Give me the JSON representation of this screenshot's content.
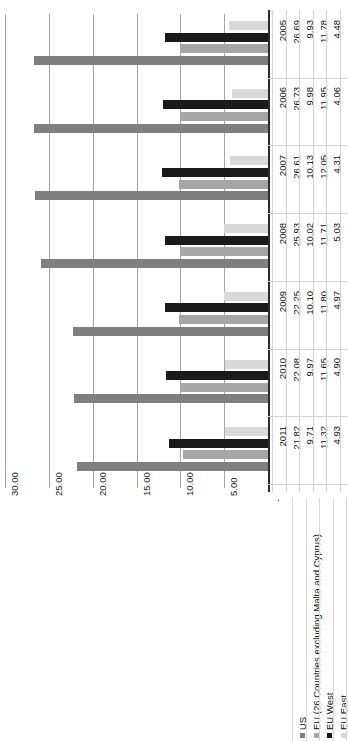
{
  "chart_data": {
    "type": "bar",
    "orientation": "horizontal",
    "title": "",
    "xlabel": "",
    "ylabel": "",
    "categories": [
      "2005",
      "2006",
      "2007",
      "2008",
      "2009",
      "2010",
      "2011"
    ],
    "series": [
      {
        "name": "US",
        "color": "#7f7f7f",
        "values": [
          26.69,
          26.73,
          26.61,
          25.93,
          22.25,
          22.08,
          21.82
        ]
      },
      {
        "name": "EU (26 Countries excluding Malta and Cyprus)",
        "color": "#a6a6a6",
        "values": [
          9.93,
          9.98,
          10.13,
          10.02,
          10.1,
          9.97,
          9.71
        ]
      },
      {
        "name": "EU West",
        "color": "#1a1a1a",
        "values": [
          11.78,
          11.95,
          12.05,
          11.71,
          11.8,
          11.65,
          11.32
        ]
      },
      {
        "name": "EU East",
        "color": "#d9d9d9",
        "values": [
          4.48,
          4.06,
          4.31,
          5.03,
          4.97,
          4.9,
          4.93
        ]
      }
    ],
    "axis_ticks": [
      "-",
      "5.00",
      "10.00",
      "15.00",
      "20.00",
      "25.00",
      "30.00"
    ],
    "axis_tick_values": [
      0,
      5,
      10,
      15,
      20,
      25,
      30
    ],
    "xlim": [
      0,
      30
    ],
    "grid": true,
    "legend_position": "bottom",
    "data_table": {
      "columns": [
        "2005",
        "2006",
        "2007",
        "2008",
        "2009",
        "2010",
        "2011"
      ],
      "rows": [
        {
          "label": "US",
          "values": [
            "26.69",
            "26.73",
            "26.61",
            "25.93",
            "22.25",
            "22.08",
            "21.82"
          ]
        },
        {
          "label": "EU (26 Countries excluding Malta and Cyprus)",
          "values": [
            "9.93",
            "9.98",
            "10.13",
            "10.02",
            "10.10",
            "9.97",
            "9.71"
          ]
        },
        {
          "label": "EU West",
          "values": [
            "11.78",
            "11.95",
            "12.05",
            "11.71",
            "11.80",
            "11.65",
            "11.32"
          ]
        },
        {
          "label": "EU East",
          "values": [
            "4.48",
            "4.06",
            "4.31",
            "5.03",
            "4.97",
            "4.90",
            "4.93"
          ]
        }
      ]
    },
    "legend": [
      {
        "label": "US",
        "color": "#7f7f7f"
      },
      {
        "label": "EU (26 Countries excluding Malta and Cyprus)",
        "color": "#a6a6a6"
      },
      {
        "label": "EU West",
        "color": "#1a1a1a"
      },
      {
        "label": "EU East",
        "color": "#d9d9d9"
      }
    ]
  }
}
